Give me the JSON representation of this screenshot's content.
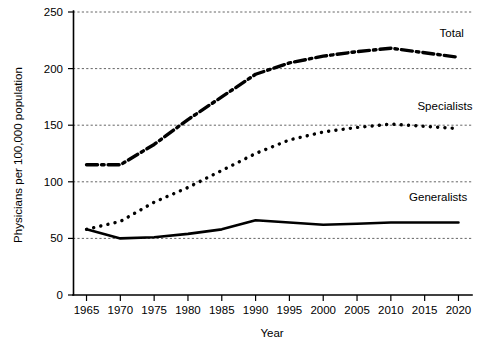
{
  "chart_data": {
    "type": "line",
    "title": "",
    "xlabel": "Year",
    "ylabel": "Physicians per 100,000 population",
    "x": [
      1965,
      1970,
      1975,
      1980,
      1985,
      1990,
      1995,
      2000,
      2005,
      2010,
      2015,
      2020
    ],
    "xlim": [
      1963,
      2022
    ],
    "ylim": [
      0,
      250
    ],
    "xticks": [
      "1965",
      "1970",
      "1975",
      "1980",
      "1985",
      "1990",
      "1995",
      "2000",
      "2005",
      "2010",
      "2015",
      "2020"
    ],
    "yticks": [
      "0",
      "50",
      "100",
      "150",
      "200",
      "250"
    ],
    "grid": "horizontal-dashed",
    "legend_position": "inline-right-of-series",
    "series": [
      {
        "name": "Total",
        "style": "dash-dot",
        "color": "#000000",
        "label_x": 2019,
        "label_y": 228,
        "values": [
          115,
          115,
          133,
          155,
          175,
          195,
          205,
          211,
          215,
          218,
          214,
          210
        ]
      },
      {
        "name": "Specialists",
        "style": "dotted",
        "color": "#000000",
        "label_x": 2018,
        "label_y": 163,
        "values": [
          58,
          65,
          82,
          95,
          110,
          125,
          137,
          144,
          148,
          151,
          149,
          147
        ]
      },
      {
        "name": "Generalists",
        "style": "solid",
        "color": "#000000",
        "label_x": 2017,
        "label_y": 83,
        "values": [
          58,
          50,
          51,
          54,
          58,
          66,
          64,
          62,
          63,
          64,
          64,
          64
        ]
      }
    ]
  }
}
